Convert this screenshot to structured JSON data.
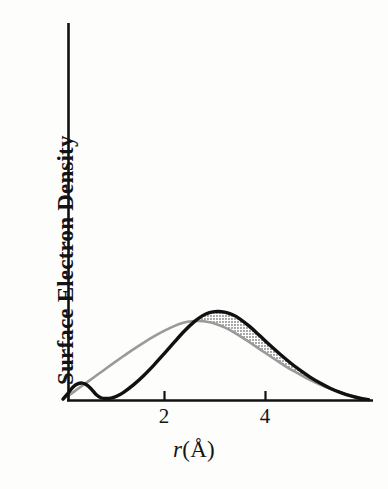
{
  "chart_data": {
    "type": "line",
    "title": "",
    "subtitle": "",
    "xlabel": "r(Å)",
    "ylabel": "Surface Electron Density",
    "xlim": [
      0,
      6.1
    ],
    "ylim": [
      0,
      1.0
    ],
    "grid": false,
    "legend": null,
    "xticks": [
      {
        "value": 2,
        "label": "2"
      },
      {
        "value": 4,
        "label": "4"
      }
    ],
    "yticks": [],
    "series": [
      {
        "name": "black-curve",
        "color": "#111111",
        "style": "solid",
        "width_px": 3.4,
        "description": "Radial density with small inner shell peak near r=0.4 and large outer peak near r=3.1",
        "x": [
          0.0,
          0.1,
          0.2,
          0.3,
          0.38,
          0.45,
          0.55,
          0.65,
          0.75,
          0.85,
          0.95,
          1.05,
          1.2,
          1.4,
          1.6,
          1.8,
          2.0,
          2.2,
          2.4,
          2.6,
          2.75,
          2.9,
          3.05,
          3.2,
          3.35,
          3.5,
          3.7,
          3.9,
          4.1,
          4.3,
          4.5,
          4.7,
          4.9,
          5.1,
          5.3,
          5.5,
          5.7,
          5.9,
          6.05
        ],
        "y": [
          0.005,
          0.035,
          0.068,
          0.085,
          0.088,
          0.082,
          0.06,
          0.03,
          0.012,
          0.008,
          0.01,
          0.018,
          0.04,
          0.08,
          0.128,
          0.182,
          0.24,
          0.3,
          0.358,
          0.408,
          0.437,
          0.455,
          0.461,
          0.458,
          0.445,
          0.423,
          0.382,
          0.334,
          0.285,
          0.238,
          0.194,
          0.154,
          0.118,
          0.087,
          0.06,
          0.038,
          0.021,
          0.008,
          0.002
        ]
      },
      {
        "name": "gray-curve",
        "color": "#9a9a9a",
        "style": "solid",
        "width_px": 2.6,
        "description": "Reference density rising near-linearly from origin to a broad flat maximum near r=2.4 then decaying below the black curve",
        "x": [
          0.0,
          0.2,
          0.4,
          0.6,
          0.8,
          1.0,
          1.2,
          1.4,
          1.6,
          1.8,
          2.0,
          2.2,
          2.4,
          2.55,
          2.7,
          2.85,
          3.0,
          3.2,
          3.4,
          3.6,
          3.8,
          4.0,
          4.2,
          4.4,
          4.6,
          4.8,
          5.0,
          5.2,
          5.4,
          5.6,
          5.8,
          6.05
        ],
        "y": [
          0.004,
          0.04,
          0.078,
          0.116,
          0.154,
          0.192,
          0.229,
          0.265,
          0.299,
          0.331,
          0.36,
          0.385,
          0.403,
          0.41,
          0.412,
          0.408,
          0.399,
          0.378,
          0.35,
          0.317,
          0.282,
          0.246,
          0.211,
          0.177,
          0.146,
          0.117,
          0.091,
          0.068,
          0.048,
          0.03,
          0.014,
          0.002
        ]
      }
    ],
    "shaded_region": {
      "name": "difference-area",
      "fill": "#bdbdbd",
      "pattern": "halftone-dots",
      "between": [
        "gray-curve",
        "black-curve"
      ],
      "x_start": 2.62,
      "x_end": 6.05,
      "description": "Gray stippled area between the gray curve (lower bound) and the black curve (upper bound) to the right of their crossing point"
    },
    "axis_color": "#111111",
    "background": "#fdfdfc"
  },
  "axes": {
    "y_axis_label": "Surface Electron Density",
    "x_axis_label": "r(Å)",
    "x_axis_label_parts": {
      "symbol": "r",
      "open": "(",
      "unit": "Å",
      "close": ")"
    },
    "tick_2": "2",
    "tick_4": "4"
  }
}
